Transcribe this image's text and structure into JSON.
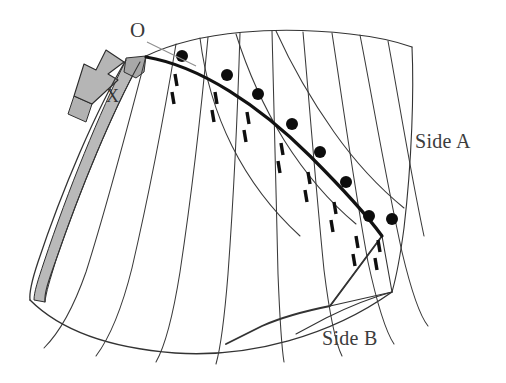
{
  "figure": {
    "type": "line-diagram",
    "title": "",
    "background_color": "#ffffff",
    "width": 506,
    "height": 383
  },
  "labels": {
    "origin": "O",
    "marker_x": "X",
    "side_a": "Side A",
    "side_b": "Side B"
  },
  "colors": {
    "ink": "#1a1a1a",
    "thin_line": "#3a3a3a",
    "bold_seam": "#111111",
    "gray_fill": "#b0b0b0",
    "gray_fill_dark": "#9a9a9a",
    "gray_fill_light": "#c9c9c9",
    "leader_line": "#8a8a8a",
    "dot_fill": "#0d0d0d",
    "text": "#2b2b2b"
  },
  "geometry": {
    "seam_dots": [
      {
        "cx": 182,
        "cy": 56,
        "r": 6
      },
      {
        "cx": 227,
        "cy": 75,
        "r": 6
      },
      {
        "cx": 258,
        "cy": 94,
        "r": 6
      },
      {
        "cx": 292,
        "cy": 124,
        "r": 6
      },
      {
        "cx": 320,
        "cy": 152,
        "r": 6
      },
      {
        "cx": 346,
        "cy": 182,
        "r": 6
      },
      {
        "cx": 369,
        "cy": 216,
        "r": 6
      },
      {
        "cx": 392,
        "cy": 219,
        "r": 6
      }
    ],
    "dot_count": 8,
    "tick_marks": [
      {
        "x1": 175,
        "y1": 74,
        "x2": 177,
        "y2": 86
      },
      {
        "x1": 172,
        "y1": 92,
        "x2": 174,
        "y2": 104
      },
      {
        "x1": 215,
        "y1": 92,
        "x2": 217,
        "y2": 104
      },
      {
        "x1": 212,
        "y1": 110,
        "x2": 214,
        "y2": 122
      },
      {
        "x1": 247,
        "y1": 112,
        "x2": 249,
        "y2": 124
      },
      {
        "x1": 244,
        "y1": 130,
        "x2": 246,
        "y2": 142
      },
      {
        "x1": 281,
        "y1": 143,
        "x2": 283,
        "y2": 155
      },
      {
        "x1": 278,
        "y1": 161,
        "x2": 280,
        "y2": 173
      },
      {
        "x1": 308,
        "y1": 172,
        "x2": 310,
        "y2": 184
      },
      {
        "x1": 305,
        "y1": 190,
        "x2": 307,
        "y2": 202
      },
      {
        "x1": 334,
        "y1": 202,
        "x2": 336,
        "y2": 214
      },
      {
        "x1": 331,
        "y1": 220,
        "x2": 333,
        "y2": 232
      },
      {
        "x1": 356,
        "y1": 236,
        "x2": 358,
        "y2": 248
      },
      {
        "x1": 353,
        "y1": 254,
        "x2": 355,
        "y2": 266
      },
      {
        "x1": 378,
        "y1": 240,
        "x2": 380,
        "y2": 252
      },
      {
        "x1": 375,
        "y1": 258,
        "x2": 377,
        "y2": 270
      }
    ],
    "tick_count": 16,
    "panel_line_count": 12,
    "leader": {
      "x1": 147,
      "y1": 42,
      "x2": 196,
      "y2": 66
    }
  },
  "paths": {
    "outer_top": "M 146 56 C 200 30 280 26 350 34 C 378 37 398 42 412 47",
    "outer_right": "M 412 47 C 414 90 412 160 404 228 C 400 258 396 278 392 292",
    "bottom_curve": "M 30 300 C 60 330 110 348 175 353 C 250 358 330 336 392 292",
    "left_edge_outer": "M 126 60 C 96 110 62 190 38 262 C 32 280 29 292 30 300",
    "left_edge_inner": "M 140 62 C 112 112 80 190 56 260 C 48 282 44 294 45 302",
    "seam_bold": "M 146 57 C 200 66 260 106 310 156 C 340 186 366 214 382 236",
    "panels": [
      "M 146 56 C 132 110 110 196 86 272 C 72 312 58 334 44 348",
      "M 176 44 C 166 104 150 190 132 268 C 120 316 108 340 96 356",
      "M 208 37 C 202 102 192 192 180 272 C 172 322 164 348 156 362",
      "M 240 33 C 238 100 234 192 228 274 C 224 324 220 350 216 364",
      "M 272 31 C 274 100 276 192 278 274 C 280 324 282 350 284 362",
      "M 303 32 C 309 100 316 190 324 270 C 330 318 336 344 342 356",
      "M 332 33 C 342 98 354 186 368 262 C 378 308 386 332 394 344",
      "M 360 35 C 372 96 386 180 402 252 C 412 294 420 316 428 326",
      "M 388 41 C 398 95 410 170 424 236"
    ],
    "inner_fan": [
      "M 200 38 C 204 70 214 110 232 146 C 252 186 276 214 300 236",
      "M 236 34 C 246 66 262 104 284 140 C 308 178 332 204 356 224",
      "M 276 31 C 290 62 310 98 334 132 C 358 166 382 190 404 208"
    ],
    "gray_arrow": "M 74 96 L 84 64 L 96 70 L 106 50 L 124 62 L 108 74 L 118 80 L 92 104 Z",
    "gray_arrow_tail": "M 74 96 L 92 104 L 86 122 L 68 114 Z",
    "gray_flap": "M 126 58 L 146 56 L 144 72 L 136 78 L 124 72 Z",
    "gray_strip": "M 126 60 C 100 112 68 190 44 262 C 38 280 34 292 34 300 L 45 302 C 46 292 50 280 56 260 C 80 190 112 112 140 62 Z",
    "triangle_fold": "M 382 236 L 392 292 L 330 306 Z",
    "fold_edge": "M 382 236 L 330 306 C 300 312 280 318 262 326 L 226 344",
    "fold_edge2": "M 392 292 C 370 298 346 308 326 318 L 296 334"
  },
  "styles": {
    "thin_stroke_width": 1.1,
    "bold_stroke_width": 3.2,
    "tick_stroke_width": 3.4,
    "leader_stroke_width": 1.0
  }
}
